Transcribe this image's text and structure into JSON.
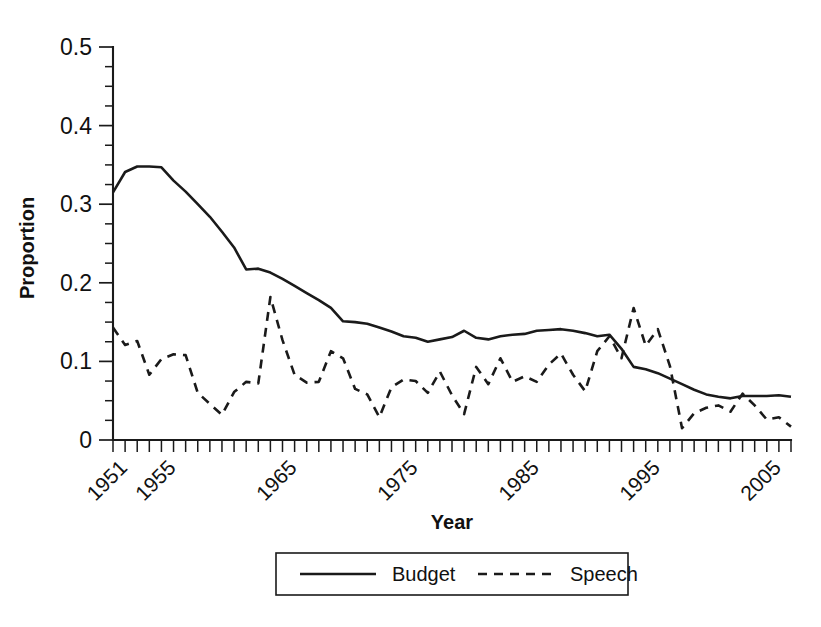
{
  "chart_data": {
    "type": "line",
    "title": "",
    "xlabel": "Year",
    "ylabel": "Proportion",
    "xlim": [
      1951,
      2007
    ],
    "ylim": [
      0,
      0.5
    ],
    "grid": false,
    "legend_position": "bottom",
    "y_ticks": [
      0,
      0.1,
      0.2,
      0.3,
      0.4,
      0.5
    ],
    "y_tick_labels": [
      "0",
      "0.1",
      "0.2",
      "0.3",
      "0.4",
      "0.5"
    ],
    "y_minor_tick_step": 0.025,
    "x_tick_labels": [
      "1951",
      "1955",
      "1965",
      "1975",
      "1985",
      "1995",
      "2005"
    ],
    "x_tick_label_values": [
      1951,
      1955,
      1965,
      1975,
      1985,
      1995,
      2005
    ],
    "x_tick_step": 1,
    "x": [
      1951,
      1952,
      1953,
      1954,
      1955,
      1956,
      1957,
      1958,
      1959,
      1960,
      1961,
      1962,
      1963,
      1964,
      1965,
      1966,
      1967,
      1968,
      1969,
      1970,
      1971,
      1972,
      1973,
      1974,
      1975,
      1976,
      1977,
      1978,
      1979,
      1980,
      1981,
      1982,
      1983,
      1984,
      1985,
      1986,
      1987,
      1988,
      1989,
      1990,
      1991,
      1992,
      1993,
      1994,
      1995,
      1996,
      1997,
      1998,
      1999,
      2000,
      2001,
      2002,
      2003,
      2004,
      2005,
      2006,
      2007
    ],
    "series": [
      {
        "name": "Budget",
        "style": "solid",
        "color": "#1a1a1a",
        "values": [
          0.315,
          0.341,
          0.348,
          0.348,
          0.347,
          0.33,
          0.316,
          0.3,
          0.284,
          0.265,
          0.245,
          0.217,
          0.218,
          0.213,
          0.205,
          0.196,
          0.187,
          0.178,
          0.168,
          0.151,
          0.15,
          0.148,
          0.143,
          0.138,
          0.132,
          0.13,
          0.125,
          0.128,
          0.131,
          0.139,
          0.13,
          0.128,
          0.132,
          0.134,
          0.135,
          0.139,
          0.14,
          0.141,
          0.139,
          0.136,
          0.132,
          0.134,
          0.116,
          0.093,
          0.09,
          0.085,
          0.078,
          0.071,
          0.064,
          0.058,
          0.055,
          0.053,
          0.056,
          0.056,
          0.056,
          0.057,
          0.055
        ]
      },
      {
        "name": "Speech",
        "style": "dashed",
        "color": "#1a1a1a",
        "values": [
          0.143,
          0.121,
          0.126,
          0.083,
          0.103,
          0.109,
          0.108,
          0.06,
          0.046,
          0.032,
          0.061,
          0.074,
          0.072,
          0.182,
          0.127,
          0.083,
          0.073,
          0.074,
          0.113,
          0.104,
          0.065,
          0.058,
          0.029,
          0.067,
          0.077,
          0.075,
          0.06,
          0.087,
          0.057,
          0.033,
          0.093,
          0.071,
          0.104,
          0.074,
          0.081,
          0.074,
          0.096,
          0.11,
          0.083,
          0.062,
          0.113,
          0.132,
          0.104,
          0.168,
          0.12,
          0.141,
          0.094,
          0.015,
          0.034,
          0.041,
          0.044,
          0.036,
          0.059,
          0.044,
          0.026,
          0.029,
          0.017
        ]
      }
    ]
  },
  "legend": {
    "entries": [
      {
        "label": "Budget",
        "style": "solid"
      },
      {
        "label": "Speech",
        "style": "dashed"
      }
    ]
  },
  "axes": {
    "x_title": "Year",
    "y_title": "Proportion"
  }
}
